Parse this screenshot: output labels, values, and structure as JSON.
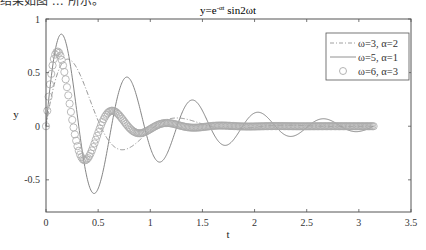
{
  "header_fragment": "结果如图 … 所示。",
  "chart_data": {
    "type": "line",
    "title_main": "y=e",
    "title_sup": "-αt",
    "title_tail": " sin2ωt",
    "xlabel": "t",
    "ylabel": "y",
    "xlim": [
      0,
      3.5
    ],
    "ylim": [
      -0.8,
      1
    ],
    "xticks": [
      0,
      0.5,
      1,
      1.5,
      2,
      2.5,
      3,
      3.5
    ],
    "xtick_labels": [
      "0",
      "0.5",
      "1",
      "1.5",
      "2",
      "2.5",
      "3",
      "3.5"
    ],
    "yticks": [
      -0.5,
      0,
      0.5,
      1
    ],
    "ytick_labels": [
      "-0.5",
      "0",
      "0.5",
      "1"
    ],
    "grid": false,
    "legend_position": "upper right",
    "t_range": [
      0,
      3.1416
    ],
    "series": [
      {
        "name": "ω=3, α=2",
        "omega": 3,
        "alpha": 2,
        "style": "dash-dot",
        "color": "#888888"
      },
      {
        "name": "ω=5, α=1",
        "omega": 5,
        "alpha": 1,
        "style": "solid",
        "color": "#777777"
      },
      {
        "name": "ω=6, α=3",
        "omega": 6,
        "alpha": 3,
        "style": "circle-markers",
        "color": "#aaaaaa"
      }
    ],
    "sample_points": {
      "t": [
        0,
        0.1,
        0.15,
        0.2,
        0.3,
        0.4,
        0.5,
        0.6,
        0.8,
        1.0,
        1.5,
        2.0,
        3.0
      ],
      "omega3_alpha2": [
        0,
        0.462,
        0.58,
        0.626,
        0.533,
        0.304,
        0.052,
        -0.132,
        -0.2,
        -0.038,
        0.02,
        -0.01,
        0.0
      ],
      "omega5_alpha1": [
        0,
        0.761,
        0.859,
        0.744,
        -0.104,
        -0.507,
        -0.582,
        -0.153,
        0.445,
        -0.2,
        0.145,
        0.123,
        0.049
      ],
      "omega6_alpha3": [
        0,
        0.69,
        0.622,
        0.371,
        -0.18,
        -0.302,
        -0.062,
        0.138,
        -0.016,
        0.025,
        0.003,
        0.0,
        0.0
      ]
    }
  }
}
